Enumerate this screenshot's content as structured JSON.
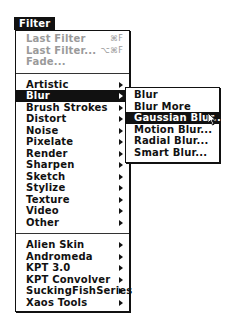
{
  "menu": {
    "title": "Filter",
    "top_items": [
      {
        "label": "Last Filter",
        "shortcut": "⌘F",
        "disabled": true
      },
      {
        "label": "Last Filter...",
        "shortcut": "⌥⌘F",
        "disabled": true
      },
      {
        "label": "Fade...",
        "disabled": true
      }
    ],
    "filter_categories": [
      {
        "label": "Artistic",
        "submenu": true
      },
      {
        "label": "Blur",
        "submenu": true,
        "selected": true
      },
      {
        "label": "Brush Strokes",
        "submenu": true
      },
      {
        "label": "Distort",
        "submenu": true
      },
      {
        "label": "Noise",
        "submenu": true
      },
      {
        "label": "Pixelate",
        "submenu": true
      },
      {
        "label": "Render",
        "submenu": true
      },
      {
        "label": "Sharpen",
        "submenu": true
      },
      {
        "label": "Sketch",
        "submenu": true
      },
      {
        "label": "Stylize",
        "submenu": true
      },
      {
        "label": "Texture",
        "submenu": true
      },
      {
        "label": "Video",
        "submenu": true
      },
      {
        "label": "Other",
        "submenu": true
      }
    ],
    "plugins": [
      {
        "label": "Alien Skin",
        "submenu": true
      },
      {
        "label": "Andromeda",
        "submenu": true
      },
      {
        "label": "KPT 3.0",
        "submenu": true
      },
      {
        "label": "KPT Convolver",
        "submenu": true
      },
      {
        "label": "SuckingFishSeries",
        "submenu": true
      },
      {
        "label": "Xaos Tools",
        "submenu": true
      }
    ]
  },
  "blur_submenu": {
    "items": [
      {
        "label": "Blur"
      },
      {
        "label": "Blur More"
      },
      {
        "label": "Gaussian Blur...",
        "selected": true
      },
      {
        "label": "Motion Blur..."
      },
      {
        "label": "Radial Blur..."
      },
      {
        "label": "Smart Blur..."
      }
    ]
  },
  "cursor": {
    "icon": "arrow-pointer-icon"
  }
}
